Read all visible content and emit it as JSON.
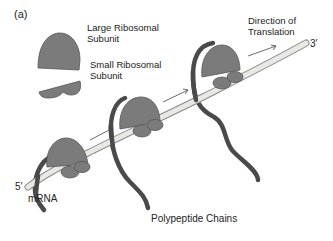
{
  "figure": {
    "panel_label": "(a)",
    "labels": {
      "large_subunit_line1": "Large Ribosomal",
      "large_subunit_line2": "Subunit",
      "small_subunit_line1": "Small Ribosomal",
      "small_subunit_line2": "Subunit",
      "direction_line1": "Direction of",
      "direction_line2": "Translation",
      "three_prime": "3′",
      "five_prime": "5′",
      "mrna": "mRNA",
      "polypeptide": "Polypeptide Chains"
    },
    "colors": {
      "subunit_fill": "#7b7b7b",
      "subunit_stroke": "#555555",
      "mrna_fill": "#e8e8e4",
      "mrna_stroke": "#8a8a8a",
      "chain": "#4a4a4a",
      "arrow": "#444444"
    }
  }
}
